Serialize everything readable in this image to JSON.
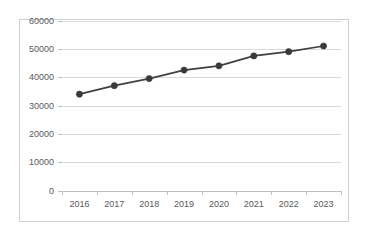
{
  "chart_data": {
    "type": "line",
    "title": "",
    "subtitle": "",
    "xlabel": "",
    "ylabel": "",
    "categories": [
      "2016",
      "2017",
      "2018",
      "2019",
      "2020",
      "2021",
      "2022",
      "2023"
    ],
    "values": [
      34000,
      37000,
      39500,
      42500,
      44000,
      47500,
      49000,
      51000
    ],
    "series": [
      {
        "name": "",
        "values": [
          34000,
          37000,
          39500,
          42500,
          44000,
          47500,
          49000,
          51000
        ]
      }
    ],
    "ylim": [
      0,
      60000
    ],
    "y_ticks": [
      0,
      10000,
      20000,
      30000,
      40000,
      50000,
      60000
    ],
    "y_tick_labels": [
      "0",
      "10000",
      "20000",
      "30000",
      "40000",
      "50000",
      "60000"
    ],
    "x_tick_labels": [
      "2016",
      "2017",
      "2018",
      "2019",
      "2020",
      "2021",
      "2022",
      "2023"
    ],
    "grid": true,
    "grid_axis": "y",
    "legend": false,
    "legend_position": "none",
    "markers": true,
    "marker_shape": "circle",
    "colors": {
      "line": "#404040",
      "marker": "#3a3a3a",
      "gridline": "#d9d9d9",
      "axis": "#bfbfbf",
      "tick_text": "#595959",
      "plot_background": "#ffffff",
      "frame_border": "#d0d0d0"
    },
    "annotations": []
  }
}
